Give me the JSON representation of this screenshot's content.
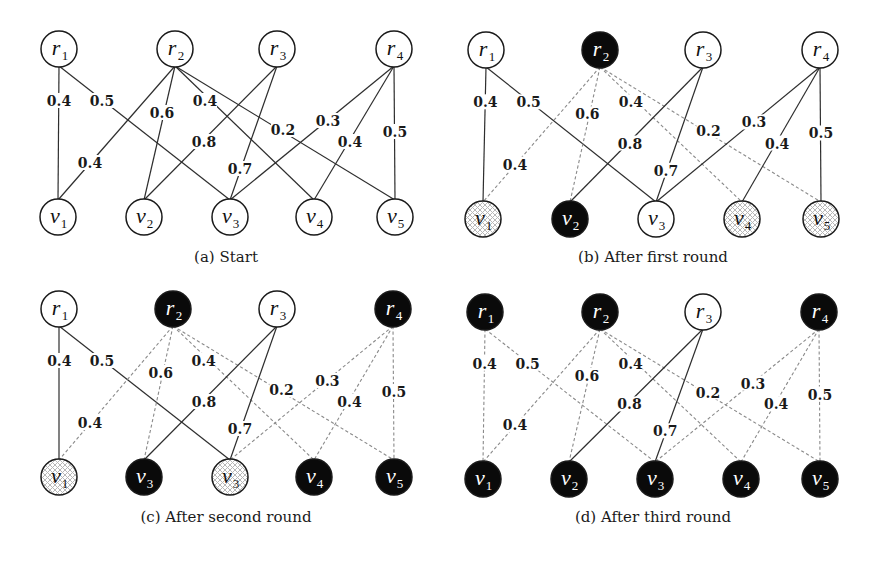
{
  "figure": {
    "node_radius": 18,
    "colors": {
      "solid_edge": "#2e2e2e",
      "dashed_edge": "#8a8a8a",
      "black_node": "#0a0a0a",
      "white_node": "#ffffff",
      "hatch": "#b8b8b8"
    },
    "edges": [
      {
        "from": "r1",
        "to": "v1",
        "weight": "0.4",
        "label_pos": [
          59,
          101
        ]
      },
      {
        "from": "r1",
        "to": "v3",
        "weight": "0.5",
        "label_pos": [
          102,
          101
        ]
      },
      {
        "from": "r2",
        "to": "v1",
        "weight": "0.4",
        "label_pos": [
          90,
          163
        ]
      },
      {
        "from": "r2",
        "to": "v2",
        "weight": "0.6",
        "label_pos": [
          162,
          113
        ]
      },
      {
        "from": "r2",
        "to": "v4",
        "weight": "0.4",
        "label_pos": [
          205,
          101
        ]
      },
      {
        "from": "r2",
        "to": "v5",
        "weight": "0.2",
        "label_pos": [
          283,
          130
        ]
      },
      {
        "from": "r3",
        "to": "v2",
        "weight": "0.8",
        "label_pos": [
          204,
          142
        ]
      },
      {
        "from": "r3",
        "to": "v3",
        "weight": "0.7",
        "label_pos": [
          240,
          169
        ]
      },
      {
        "from": "r4",
        "to": "v3",
        "weight": "0.3",
        "label_pos": [
          328,
          121
        ]
      },
      {
        "from": "r4",
        "to": "v4",
        "weight": "0.4",
        "label_pos": [
          350,
          142
        ]
      },
      {
        "from": "r4",
        "to": "v5",
        "weight": "0.5",
        "label_pos": [
          395,
          132
        ]
      }
    ],
    "panels": [
      {
        "id": "a",
        "caption": "(a) Start",
        "offset": [
          0,
          0
        ],
        "caption_pos": [
          226,
          262
        ],
        "nodes": [
          {
            "id": "r1",
            "base": "r",
            "sub": "1",
            "pos": [
              59,
              49
            ],
            "state": "white"
          },
          {
            "id": "r2",
            "base": "r",
            "sub": "2",
            "pos": [
              175,
              49
            ],
            "state": "white"
          },
          {
            "id": "r3",
            "base": "r",
            "sub": "3",
            "pos": [
              277,
              49
            ],
            "state": "white"
          },
          {
            "id": "r4",
            "base": "r",
            "sub": "4",
            "pos": [
              394,
              49
            ],
            "state": "white"
          },
          {
            "id": "v1",
            "base": "v",
            "sub": "1",
            "pos": [
              58,
              217
            ],
            "state": "white"
          },
          {
            "id": "v2",
            "base": "v",
            "sub": "2",
            "pos": [
              144,
              217
            ],
            "state": "white"
          },
          {
            "id": "v3",
            "base": "v",
            "sub": "3",
            "pos": [
              230,
              217
            ],
            "state": "white"
          },
          {
            "id": "v4",
            "base": "v",
            "sub": "4",
            "pos": [
              314,
              217
            ],
            "state": "white"
          },
          {
            "id": "v5",
            "base": "v",
            "sub": "5",
            "pos": [
              395,
              217
            ],
            "state": "white"
          }
        ],
        "edge_styles": {
          "r1-v1": "solid",
          "r1-v3": "solid",
          "r2-v1": "solid",
          "r2-v2": "solid",
          "r2-v4": "solid",
          "r2-v5": "solid",
          "r3-v2": "solid",
          "r3-v3": "solid",
          "r4-v3": "solid",
          "r4-v4": "solid",
          "r4-v5": "solid"
        }
      },
      {
        "id": "b",
        "caption": "(b) After first round",
        "offset": [
          427,
          1
        ],
        "caption_pos": [
          653,
          262
        ],
        "nodes": [
          {
            "id": "r1",
            "base": "r",
            "sub": "1",
            "pos": [
              486,
              50
            ],
            "state": "white"
          },
          {
            "id": "r2",
            "base": "r",
            "sub": "2",
            "pos": [
              600,
              50
            ],
            "state": "black"
          },
          {
            "id": "r3",
            "base": "r",
            "sub": "3",
            "pos": [
              703,
              50
            ],
            "state": "white"
          },
          {
            "id": "r4",
            "base": "r",
            "sub": "4",
            "pos": [
              820,
              50
            ],
            "state": "white"
          },
          {
            "id": "v1",
            "base": "v",
            "sub": "1",
            "pos": [
              483,
              219
            ],
            "state": "hatched"
          },
          {
            "id": "v2",
            "base": "v",
            "sub": "2",
            "pos": [
              570,
              219
            ],
            "state": "black"
          },
          {
            "id": "v3",
            "base": "v",
            "sub": "3",
            "pos": [
              656,
              219
            ],
            "state": "white"
          },
          {
            "id": "v4",
            "base": "v",
            "sub": "4",
            "pos": [
              742,
              219
            ],
            "state": "hatched"
          },
          {
            "id": "v5",
            "base": "v",
            "sub": "5",
            "pos": [
              821,
              219
            ],
            "state": "hatched"
          }
        ],
        "edge_styles": {
          "r1-v1": "solid",
          "r1-v3": "solid",
          "r2-v1": "dashed",
          "r2-v2": "dashed",
          "r2-v4": "dashed",
          "r2-v5": "dashed",
          "r3-v2": "solid",
          "r3-v3": "solid",
          "r4-v3": "solid",
          "r4-v4": "solid",
          "r4-v5": "solid"
        }
      },
      {
        "id": "c",
        "caption": "(c) After second round",
        "offset": [
          0,
          260
        ],
        "caption_pos": [
          226,
          522
        ],
        "nodes": [
          {
            "id": "r1",
            "base": "r",
            "sub": "1",
            "pos": [
              59,
              309
            ],
            "state": "white"
          },
          {
            "id": "r2",
            "base": "r",
            "sub": "2",
            "pos": [
              173,
              309
            ],
            "state": "black"
          },
          {
            "id": "r3",
            "base": "r",
            "sub": "3",
            "pos": [
              277,
              309
            ],
            "state": "white"
          },
          {
            "id": "r4",
            "base": "r",
            "sub": "4",
            "pos": [
              393,
              309
            ],
            "state": "black"
          },
          {
            "id": "v1",
            "base": "v",
            "sub": "1",
            "pos": [
              59,
              477
            ],
            "state": "hatched"
          },
          {
            "id": "v2",
            "base": "v",
            "sub": "3",
            "pos": [
              144,
              477
            ],
            "state": "black"
          },
          {
            "id": "v3",
            "base": "v",
            "sub": "3",
            "pos": [
              230,
              477
            ],
            "state": "hatched"
          },
          {
            "id": "v4",
            "base": "v",
            "sub": "4",
            "pos": [
              314,
              477
            ],
            "state": "black"
          },
          {
            "id": "v5",
            "base": "v",
            "sub": "5",
            "pos": [
              394,
              477
            ],
            "state": "black"
          }
        ],
        "edge_styles": {
          "r1-v1": "solid",
          "r1-v3": "solid",
          "r2-v1": "dashed",
          "r2-v2": "dashed",
          "r2-v4": "dashed",
          "r2-v5": "dashed",
          "r3-v2": "solid",
          "r3-v3": "solid",
          "r4-v3": "dashed",
          "r4-v4": "dashed",
          "r4-v5": "dashed"
        }
      },
      {
        "id": "d",
        "caption": "(d) After third round",
        "offset": [
          427,
          262
        ],
        "caption_pos": [
          653,
          522
        ],
        "nodes": [
          {
            "id": "r1",
            "base": "r",
            "sub": "1",
            "pos": [
              485,
              312
            ],
            "state": "black"
          },
          {
            "id": "r2",
            "base": "r",
            "sub": "2",
            "pos": [
              600,
              312
            ],
            "state": "black"
          },
          {
            "id": "r3",
            "base": "r",
            "sub": "3",
            "pos": [
              703,
              312
            ],
            "state": "white"
          },
          {
            "id": "r4",
            "base": "r",
            "sub": "4",
            "pos": [
              819,
              312
            ],
            "state": "black"
          },
          {
            "id": "v1",
            "base": "v",
            "sub": "1",
            "pos": [
              483,
              479
            ],
            "state": "black"
          },
          {
            "id": "v2",
            "base": "v",
            "sub": "2",
            "pos": [
              569,
              479
            ],
            "state": "black"
          },
          {
            "id": "v3",
            "base": "v",
            "sub": "3",
            "pos": [
              655,
              479
            ],
            "state": "black"
          },
          {
            "id": "v4",
            "base": "v",
            "sub": "4",
            "pos": [
              741,
              479
            ],
            "state": "black"
          },
          {
            "id": "v5",
            "base": "v",
            "sub": "5",
            "pos": [
              820,
              479
            ],
            "state": "black"
          }
        ],
        "edge_styles": {
          "r1-v1": "dashed",
          "r1-v3": "dashed",
          "r2-v1": "dashed",
          "r2-v2": "dashed",
          "r2-v4": "dashed",
          "r2-v5": "dashed",
          "r3-v2": "solid",
          "r3-v3": "solid",
          "r4-v3": "dashed",
          "r4-v4": "dashed",
          "r4-v5": "dashed"
        }
      }
    ]
  }
}
